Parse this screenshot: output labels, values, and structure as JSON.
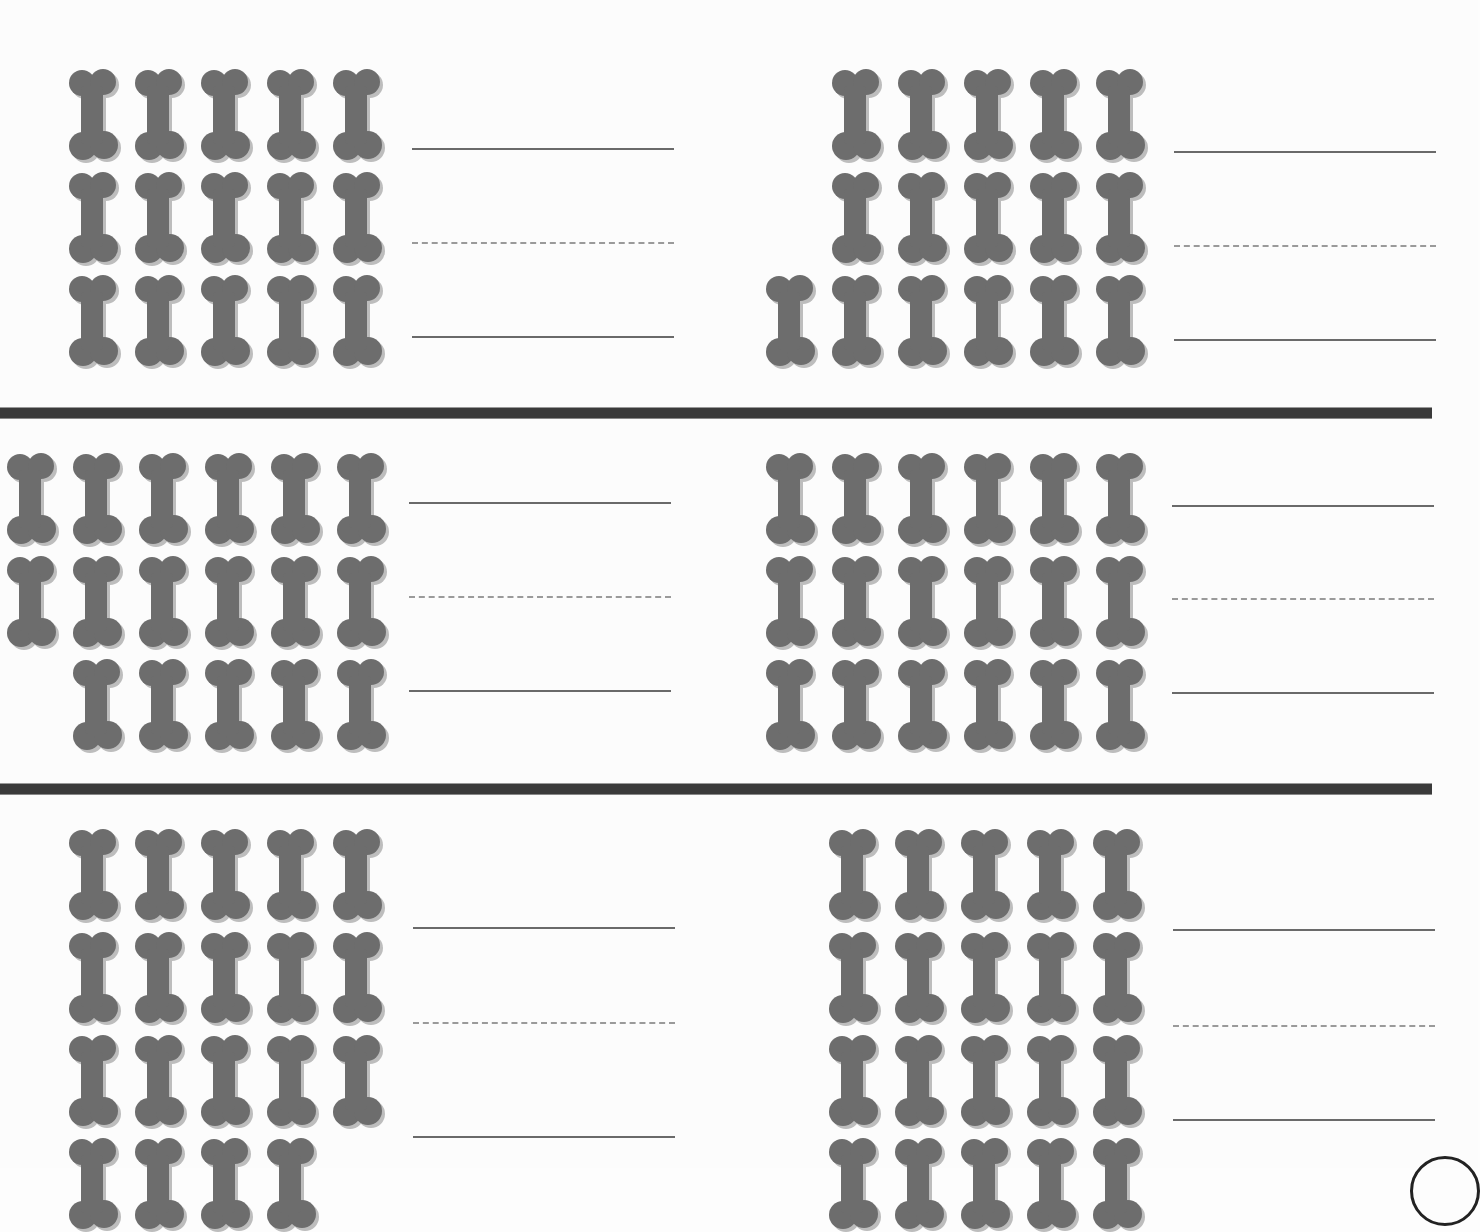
{
  "worksheet": {
    "colors": {
      "bone_fill": "#6d6d6d",
      "bone_shadow": "#bdbdbd",
      "divider": "#3a3a3a",
      "solid_line": "#6a6a6a",
      "dashed_line": "#9a9a9a"
    },
    "problems": [
      {
        "id": 1,
        "rows": [
          5,
          5,
          5
        ],
        "row_offsets": [
          0,
          0,
          0
        ],
        "total": 15
      },
      {
        "id": 2,
        "rows": [
          5,
          5,
          6
        ],
        "row_offsets": [
          1,
          1,
          0
        ],
        "total": 16
      },
      {
        "id": 3,
        "rows": [
          6,
          6,
          5
        ],
        "row_offsets": [
          0,
          0,
          1
        ],
        "total": 17
      },
      {
        "id": 4,
        "rows": [
          6,
          6,
          6
        ],
        "row_offsets": [
          0,
          0,
          0
        ],
        "total": 18
      },
      {
        "id": 5,
        "rows": [
          5,
          5,
          5,
          4
        ],
        "row_offsets": [
          0,
          0,
          0,
          0
        ],
        "total": 19
      },
      {
        "id": 6,
        "rows": [
          5,
          5,
          5,
          5
        ],
        "row_offsets": [
          0,
          0,
          0,
          0
        ],
        "total": 20
      }
    ],
    "answer_lines_per_problem": [
      "solid",
      "dashed",
      "solid"
    ],
    "icon": "dog-bone-icon"
  }
}
